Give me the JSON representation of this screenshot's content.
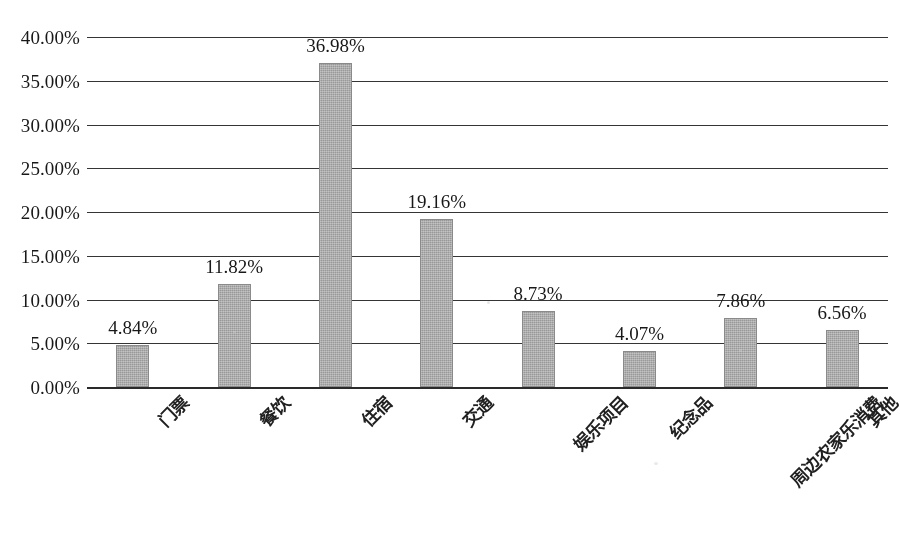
{
  "chart_data": {
    "type": "bar",
    "title": "",
    "subtitle": "",
    "xlabel": "",
    "ylabel": "",
    "categories": [
      "门票",
      "餐饮",
      "住宿",
      "交通",
      "娱乐项目",
      "纪念品",
      "周边农家乐消费",
      "其他"
    ],
    "values": [
      4.84,
      11.82,
      36.98,
      19.16,
      8.73,
      4.07,
      7.86,
      6.56
    ],
    "value_labels": [
      "4.84%",
      "11.82%",
      "36.98%",
      "19.16%",
      "8.73%",
      "4.07%",
      "7.86%",
      "6.56%"
    ],
    "ylim": [
      0,
      40
    ],
    "ytick_values": [
      40,
      35,
      30,
      25,
      20,
      15,
      10,
      5,
      0
    ],
    "ytick_labels": [
      "40.00%",
      "35.00%",
      "30.00%",
      "25.00%",
      "20.00%",
      "15.00%",
      "10.00%",
      "5.00%",
      "0.00%"
    ],
    "grid": true,
    "grid_axis": "y",
    "legend": false,
    "legend_position": "none",
    "bar_color": "#a9a9a9",
    "bar_edge_color": "#8a8a8a",
    "axis_color": "#1c1c1c",
    "background_color": "#ffffff",
    "text_color": "#1a1a1a",
    "series": [
      {
        "name": "",
        "values": [
          4.84,
          11.82,
          36.98,
          19.16,
          8.73,
          4.07,
          7.86,
          6.56
        ]
      }
    ]
  }
}
